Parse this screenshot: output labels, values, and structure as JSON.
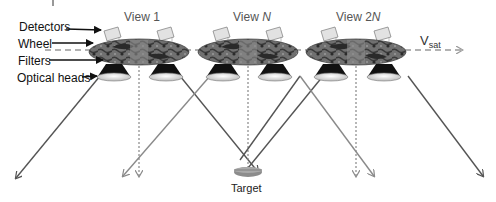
{
  "diagram": {
    "labels": {
      "detectors": "Detectors",
      "wheel": "Wheel",
      "filters": "Filters",
      "optical_heads": "Optical heads",
      "target": "Target"
    },
    "views": [
      {
        "prefix": "View ",
        "suffix": "1",
        "italic": false
      },
      {
        "prefix": "View ",
        "suffix": "N",
        "italic": true
      },
      {
        "prefix": "View 2",
        "suffix": "N",
        "italic": true
      }
    ],
    "velocity": {
      "base": "V",
      "subscript": "sat"
    },
    "colors": {
      "wheel": "#6e6e6e",
      "wheel_dark": "#2a2a2a",
      "optical_head": "#111111",
      "lens": "#e8e8e8",
      "ray_dark": "#555555",
      "ray_light": "#8a8a8a",
      "dashed_axis": "#999999",
      "target": "#8c8c8c"
    }
  }
}
